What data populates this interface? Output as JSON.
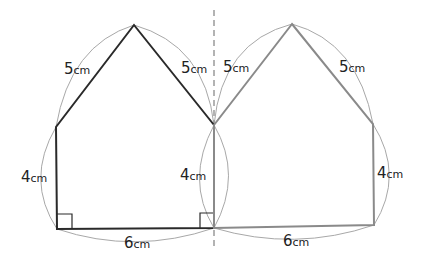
{
  "diagram": {
    "colors": {
      "original_edge": "#2a2a2a",
      "reflected_edge": "#8a8a8a",
      "arc": "#a8a8a8",
      "dashed_axis": "#9a9a9a",
      "label": "#222222",
      "background": "#ffffff"
    },
    "left_pentagon": {
      "vertices": [
        [
          134,
          25
        ],
        [
          214,
          125
        ],
        [
          214,
          228
        ],
        [
          57,
          229
        ],
        [
          56,
          127
        ]
      ],
      "labels": {
        "left_slope": {
          "num": "5",
          "unit": "cm"
        },
        "right_slope": {
          "num": "5",
          "unit": "cm"
        },
        "left_side": {
          "num": "4",
          "unit": "cm"
        },
        "right_side": {
          "num": "4",
          "unit": "cm"
        },
        "bottom": {
          "num": "6",
          "unit": "cm"
        }
      }
    },
    "right_pentagon": {
      "vertices": [
        [
          292,
          24
        ],
        [
          373,
          124
        ],
        [
          374,
          225
        ],
        [
          214,
          228
        ],
        [
          214,
          125
        ]
      ],
      "labels": {
        "left_slope": {
          "num": "5",
          "unit": "cm"
        },
        "right_slope": {
          "num": "5",
          "unit": "cm"
        },
        "right_side": {
          "num": "4",
          "unit": "cm"
        },
        "bottom": {
          "num": "6",
          "unit": "cm"
        }
      }
    },
    "axis": {
      "x": 214,
      "y1": 10,
      "y2": 247,
      "style": "dashed"
    }
  }
}
